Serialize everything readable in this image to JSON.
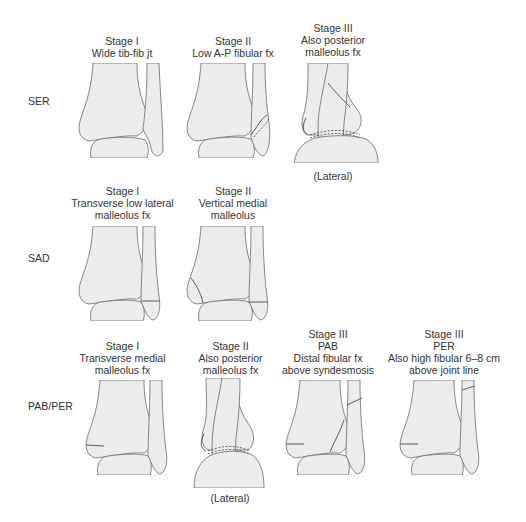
{
  "rows": [
    {
      "label": "SER",
      "stages": [
        {
          "lines": [
            "Stage I",
            "Wide tib-fib jt"
          ],
          "view": "ap",
          "fracture": "wide-tib-fib"
        },
        {
          "lines": [
            "Stage II",
            "Low A-P fibular fx"
          ],
          "view": "ap",
          "fracture": "low-ap-fibular"
        },
        {
          "lines": [
            "Stage III",
            "Also posterior",
            "malleolus fx"
          ],
          "view": "lateral",
          "fracture": "posterior-malleolus",
          "sublabel": "(Lateral)"
        }
      ]
    },
    {
      "label": "SAD",
      "stages": [
        {
          "lines": [
            "Stage I",
            "Transverse low lateral",
            "malleolus fx"
          ],
          "view": "ap",
          "fracture": "transverse-lateral"
        },
        {
          "lines": [
            "Stage II",
            "Vertical medial",
            "malleolus"
          ],
          "view": "ap",
          "fracture": "vertical-medial"
        }
      ]
    },
    {
      "label": "PAB/PER",
      "stages": [
        {
          "lines": [
            "Stage I",
            "Transverse medial",
            "malleolus fx"
          ],
          "view": "ap",
          "fracture": "transverse-medial"
        },
        {
          "lines": [
            "Stage II",
            "Also posterior",
            "malleolus fx"
          ],
          "view": "lateral",
          "fracture": "posterior-malleolus",
          "sublabel": "(Lateral)"
        },
        {
          "lines": [
            "Stage III",
            "PAB",
            "Distal fibular fx",
            "above syndesmosis"
          ],
          "view": "ap",
          "fracture": "distal-fibular"
        },
        {
          "lines": [
            "Stage III",
            "PER",
            "Also high fibular 6–8 cm",
            "above joint line"
          ],
          "view": "ap",
          "fracture": "high-fibular"
        }
      ]
    }
  ],
  "colors": {
    "bone_fill": "#ececec",
    "outline": "#6a6a6a",
    "fracture_line": "#4a4a4a",
    "text": "#333333"
  }
}
